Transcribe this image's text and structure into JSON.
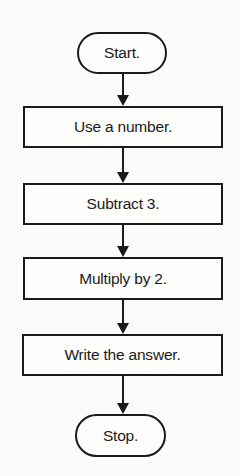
{
  "flowchart": {
    "nodes": [
      {
        "id": "start",
        "type": "terminal",
        "label": "Start."
      },
      {
        "id": "step1",
        "type": "process",
        "label": "Use a number."
      },
      {
        "id": "step2",
        "type": "process",
        "label": "Subtract 3."
      },
      {
        "id": "step3",
        "type": "process",
        "label": "Multiply by 2."
      },
      {
        "id": "step4",
        "type": "process",
        "label": "Write the answer."
      },
      {
        "id": "stop",
        "type": "terminal",
        "label": "Stop."
      }
    ],
    "edges": [
      {
        "from": "start",
        "to": "step1"
      },
      {
        "from": "step1",
        "to": "step2"
      },
      {
        "from": "step2",
        "to": "step3"
      },
      {
        "from": "step3",
        "to": "step4"
      },
      {
        "from": "step4",
        "to": "stop"
      }
    ]
  }
}
